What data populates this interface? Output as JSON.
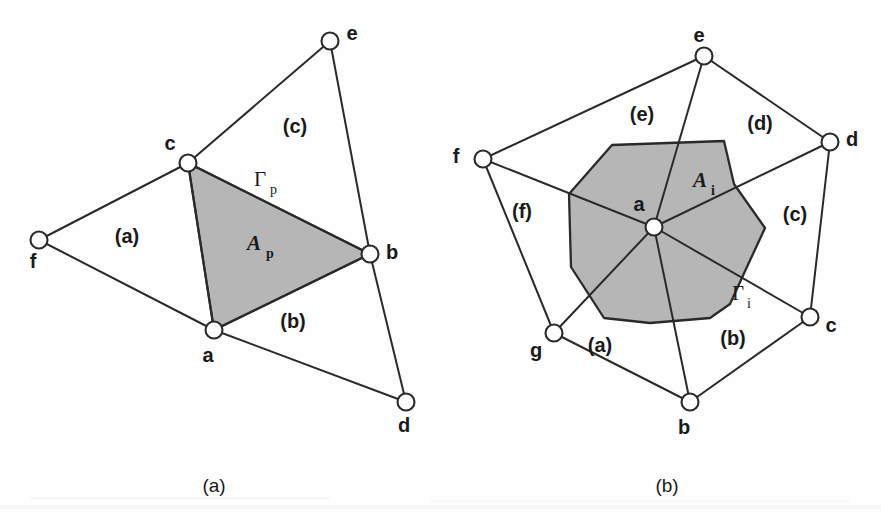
{
  "figure": {
    "background_color": "#fefefe",
    "ink_color": "#2a2a2a",
    "shade_color": "#b6b6b6"
  },
  "panels": [
    {
      "id": "panel-a",
      "caption": "(a)",
      "caption_pos": {
        "x": 214,
        "y": 492
      },
      "description": "Cell-centred (element based) control volume over a triangle",
      "nodes": [
        {
          "name": "f",
          "label": "f",
          "cx": 39,
          "cy": 240,
          "lx": 33,
          "ly": 268
        },
        {
          "name": "c",
          "label": "c",
          "cx": 188,
          "cy": 163,
          "lx": 170,
          "ly": 150
        },
        {
          "name": "e",
          "label": "e",
          "cx": 330,
          "cy": 41,
          "lx": 352,
          "ly": 40
        },
        {
          "name": "b",
          "label": "b",
          "cx": 370,
          "cy": 254,
          "lx": 392,
          "ly": 259
        },
        {
          "name": "a",
          "label": "a",
          "cx": 214,
          "cy": 330,
          "lx": 208,
          "ly": 362
        },
        {
          "name": "d",
          "label": "d",
          "cx": 406,
          "cy": 402,
          "lx": 404,
          "ly": 432
        }
      ],
      "edges": [
        {
          "from": "f",
          "to": "c"
        },
        {
          "from": "f",
          "to": "a"
        },
        {
          "from": "c",
          "to": "a"
        },
        {
          "from": "c",
          "to": "e"
        },
        {
          "from": "c",
          "to": "b"
        },
        {
          "from": "a",
          "to": "b"
        },
        {
          "from": "a",
          "to": "d"
        },
        {
          "from": "e",
          "to": "b"
        },
        {
          "from": "b",
          "to": "d"
        }
      ],
      "shaded_region": {
        "name": "control-volume-Ap",
        "points": "188,163 370,254 214,330"
      },
      "cell_labels": [
        {
          "label": "(a)",
          "x": 127,
          "y": 243
        },
        {
          "label": "(b)",
          "x": 293,
          "y": 328
        },
        {
          "label": "(c)",
          "x": 295,
          "y": 133
        }
      ],
      "annotations": [
        {
          "name": "area-label-Ap",
          "base": "A",
          "sub": "p",
          "x": 254,
          "y": 250
        },
        {
          "name": "gamma-label-Gp",
          "base": "Γ",
          "sub": "p",
          "x": 260,
          "y": 186
        }
      ]
    },
    {
      "id": "panel-b",
      "caption": "(b)",
      "caption_pos": {
        "x": 667,
        "y": 492
      },
      "description": "Vertex centred (median dual) control volume around node a",
      "nodes": [
        {
          "name": "a",
          "label": "a",
          "cx": 654,
          "cy": 227,
          "lx": 639,
          "ly": 211
        },
        {
          "name": "e",
          "label": "e",
          "cx": 704,
          "cy": 56,
          "lx": 699,
          "ly": 42
        },
        {
          "name": "d",
          "label": "d",
          "cx": 830,
          "cy": 142,
          "lx": 852,
          "ly": 146
        },
        {
          "name": "c",
          "label": "c",
          "cx": 810,
          "cy": 317,
          "lx": 831,
          "ly": 332
        },
        {
          "name": "b",
          "label": "b",
          "cx": 690,
          "cy": 402,
          "lx": 684,
          "ly": 434
        },
        {
          "name": "g",
          "label": "g",
          "cx": 554,
          "cy": 333,
          "lx": 536,
          "ly": 357
        },
        {
          "name": "f",
          "label": "f",
          "cx": 483,
          "cy": 159,
          "lx": 456,
          "ly": 163
        }
      ],
      "edges": [
        {
          "from": "a",
          "to": "e"
        },
        {
          "from": "a",
          "to": "d"
        },
        {
          "from": "a",
          "to": "c"
        },
        {
          "from": "a",
          "to": "b"
        },
        {
          "from": "a",
          "to": "g"
        },
        {
          "from": "a",
          "to": "f"
        },
        {
          "from": "f",
          "to": "e"
        },
        {
          "from": "e",
          "to": "d"
        },
        {
          "from": "d",
          "to": "c"
        },
        {
          "from": "c",
          "to": "b"
        },
        {
          "from": "b",
          "to": "g"
        },
        {
          "from": "g",
          "to": "f"
        }
      ],
      "shaded_region": {
        "name": "control-volume-Ai",
        "points": "612,145 724,141 734,184 765,228 746,269 730,304 710,318 650,323 604,318 571,267 569,194"
      },
      "cell_labels": [
        {
          "label": "(a)",
          "x": 600,
          "y": 352
        },
        {
          "label": "(b)",
          "x": 733,
          "y": 345
        },
        {
          "label": "(c)",
          "x": 795,
          "y": 221
        },
        {
          "label": "(d)",
          "x": 760,
          "y": 130
        },
        {
          "label": "(e)",
          "x": 642,
          "y": 121
        },
        {
          "label": "(f)",
          "x": 522,
          "y": 218
        }
      ],
      "annotations": [
        {
          "name": "area-label-Ai",
          "base": "A",
          "sub": "i",
          "x": 700,
          "y": 187
        },
        {
          "name": "gamma-label-Gi",
          "base": "Γ",
          "sub": "i",
          "x": 738,
          "y": 300
        }
      ]
    }
  ]
}
